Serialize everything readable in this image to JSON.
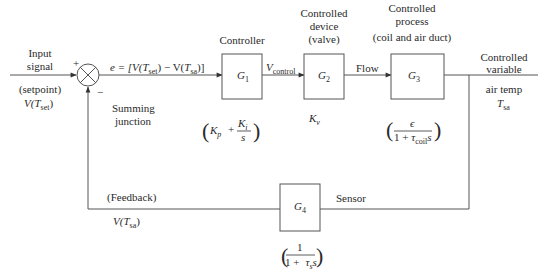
{
  "diagram": {
    "type": "control-loop-block-diagram",
    "input": {
      "label_line1": "Input",
      "label_line2": "signal",
      "setpoint_label": "(setpoint)",
      "setpoint_var": "V(",
      "setpoint_T": "T",
      "setpoint_sub": "set",
      "setpoint_close": ")"
    },
    "summing_junction": {
      "plus_sign": "+",
      "minus_sign": "−",
      "label_line1": "Summing",
      "label_line2": "junction"
    },
    "error_signal": {
      "prefix": "e = [V(",
      "T1": "T",
      "sub1": "set",
      "mid": ")  − V(",
      "T2": "T",
      "sub2": "sa",
      "suffix": ")]"
    },
    "blocks": [
      {
        "id": "G1",
        "symbol": "G",
        "sub": "1",
        "title_lines": [
          "Controller"
        ],
        "transfer_function": {
          "open": "(",
          "Kp": "K",
          "Kp_sub": "p",
          "plus": "+",
          "num": "K",
          "num_sub": "i",
          "den": "s",
          "close": ")"
        }
      },
      {
        "id": "G2",
        "symbol": "G",
        "sub": "2",
        "title_lines": [
          "Controlled",
          "device",
          "(valve)"
        ],
        "transfer_function": {
          "K": "K",
          "sub": "v"
        }
      },
      {
        "id": "G3",
        "symbol": "G",
        "sub": "3",
        "title_lines": [
          "Controlled",
          "process",
          "(coil and air duct)"
        ],
        "transfer_function": {
          "open": "(",
          "num": "ϵ",
          "den_prefix": "1 + ",
          "tau": "τ",
          "tau_sub": "coil",
          "s": "s",
          "close": ")"
        }
      },
      {
        "id": "G4",
        "symbol": "G",
        "sub": "4",
        "title_lines": [
          "Sensor"
        ],
        "transfer_function": {
          "open": "(",
          "num": "1",
          "den_prefix": "1 +",
          "tau": "τ",
          "tau_sub": "s",
          "s": "s",
          "close": ")"
        }
      }
    ],
    "signals": {
      "v_control": "V",
      "v_control_sub": "control",
      "flow": "Flow"
    },
    "output": {
      "label_line1": "Controlled",
      "label_line2": "variable",
      "label_line3": "air temp",
      "var": "T",
      "var_sub": "sa"
    },
    "feedback": {
      "label": "(Feedback)",
      "var_prefix": "V(",
      "var_T": "T",
      "var_sub": "sa",
      "var_close": ")"
    },
    "colors": {
      "line": "#555555",
      "text": "#2a2a2a",
      "background": "#ffffff"
    }
  }
}
